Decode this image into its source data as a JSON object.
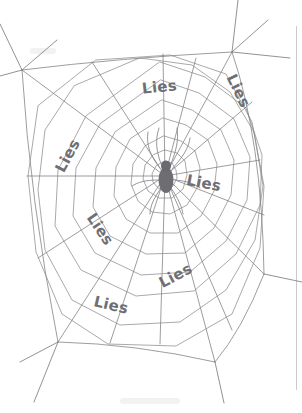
{
  "image": {
    "title": "Spider web with Lies labels",
    "background_color": "#ffffff",
    "line_color": "#7c7c80",
    "text_color": "#6f6f73",
    "spider_color": "#6e6e72",
    "page_edge_color": "#c9c9cd",
    "width": 302,
    "height": 413
  },
  "web": {
    "center_x": 165,
    "center_y": 176,
    "spoke_count": 16,
    "ring_count": 9,
    "spider_name": "spider"
  },
  "labels": [
    {
      "id": "lies-top",
      "text": "Lies",
      "x": 160,
      "y": 92,
      "rotate": -6,
      "size": 16
    },
    {
      "id": "lies-top-right",
      "text": "Lies",
      "x": 234,
      "y": 93,
      "rotate": 64,
      "size": 16
    },
    {
      "id": "lies-left",
      "text": "Lies",
      "x": 72,
      "y": 158,
      "rotate": -62,
      "size": 16
    },
    {
      "id": "lies-right",
      "text": "Lies",
      "x": 203,
      "y": 188,
      "rotate": 11,
      "size": 16
    },
    {
      "id": "lies-lower-left",
      "text": "Lies",
      "x": 96,
      "y": 232,
      "rotate": 56,
      "size": 15
    },
    {
      "id": "lies-lower-right",
      "text": "Lies",
      "x": 178,
      "y": 280,
      "rotate": -28,
      "size": 15
    },
    {
      "id": "lies-bottom",
      "text": "Lies",
      "x": 110,
      "y": 310,
      "rotate": 13,
      "size": 16
    }
  ]
}
